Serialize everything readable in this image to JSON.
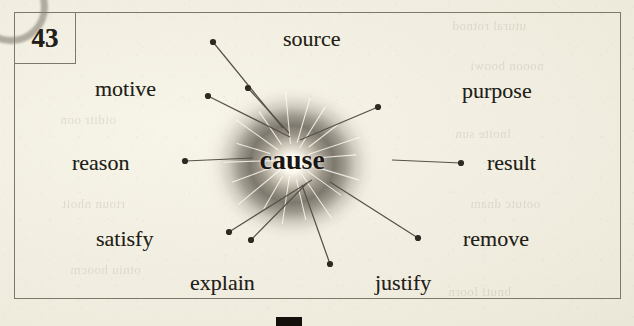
{
  "entry": {
    "number": "43",
    "center_word": "cause"
  },
  "colors": {
    "paper": "#f1eee1",
    "ink": "#231f18",
    "frame": "#7e786a",
    "leader": "#57514a",
    "burst_core": "#fffdf6",
    "burst_ring": "#706b60"
  },
  "diagram": {
    "type": "word-association-starburst",
    "center": {
      "x": 292,
      "y": 160
    },
    "labels": [
      {
        "id": "source",
        "text": "source",
        "text_x": 283,
        "text_y": 28,
        "dot_x": 213,
        "dot_y": 42,
        "line_end_x": 283,
        "line_end_y": 128
      },
      {
        "id": "motive",
        "text": "motive",
        "text_x": 95,
        "text_y": 78,
        "dot_x": 248,
        "dot_y": 88,
        "line_end_x": 289,
        "line_end_y": 133
      },
      {
        "id": "purpose",
        "text": "purpose",
        "text_x": 462,
        "text_y": 80,
        "dot_x": 378,
        "dot_y": 107,
        "line_end_x": 300,
        "line_end_y": 140
      },
      {
        "id": "reason",
        "text": "reason",
        "text_x": 72,
        "text_y": 152,
        "dot_x": 185,
        "dot_y": 161,
        "line_end_x": 253,
        "line_end_y": 158
      },
      {
        "id": "result",
        "text": "result",
        "text_x": 487,
        "text_y": 152,
        "dot_x": 461,
        "dot_y": 163,
        "line_end_x": 392,
        "line_end_y": 160
      },
      {
        "id": "satisfy",
        "text": "satisfy",
        "text_x": 96,
        "text_y": 228,
        "dot_x": 208,
        "dot_y": 96,
        "line_end_x": 290,
        "line_end_y": 137
      },
      {
        "id": "explain",
        "text": "explain",
        "text_x": 190,
        "text_y": 272,
        "dot_x": 251,
        "dot_y": 240,
        "line_end_x": 307,
        "line_end_y": 183
      },
      {
        "id": "justify",
        "text": "justify",
        "text_x": 375,
        "text_y": 272,
        "dot_x": 330,
        "dot_y": 264,
        "line_end_x": 302,
        "line_end_y": 185
      },
      {
        "id": "remove",
        "text": "remove",
        "text_x": 463,
        "text_y": 228,
        "dot_x": 418,
        "dot_y": 238,
        "line_end_x": 330,
        "line_end_y": 182
      },
      {
        "id": "extra-left",
        "text": "",
        "text_x": 0,
        "text_y": 0,
        "dot_x": 229,
        "dot_y": 232,
        "line_end_x": 312,
        "line_end_y": 180
      }
    ],
    "spokes": [
      {
        "a": 265,
        "r1": 18,
        "r2": 74
      },
      {
        "a": 285,
        "r1": 20,
        "r2": 70
      },
      {
        "a": 300,
        "r1": 16,
        "r2": 66
      },
      {
        "a": 320,
        "r1": 22,
        "r2": 60
      },
      {
        "a": 340,
        "r1": 18,
        "r2": 72
      },
      {
        "a": 355,
        "r1": 24,
        "r2": 64
      },
      {
        "a": 18,
        "r1": 18,
        "r2": 70
      },
      {
        "a": 38,
        "r1": 20,
        "r2": 62
      },
      {
        "a": 58,
        "r1": 16,
        "r2": 74
      },
      {
        "a": 78,
        "r1": 22,
        "r2": 66
      },
      {
        "a": 98,
        "r1": 18,
        "r2": 70
      },
      {
        "a": 118,
        "r1": 20,
        "r2": 60
      },
      {
        "a": 138,
        "r1": 17,
        "r2": 72
      },
      {
        "a": 158,
        "r1": 21,
        "r2": 64
      },
      {
        "a": 178,
        "r1": 19,
        "r2": 68
      },
      {
        "a": 198,
        "r1": 23,
        "r2": 58
      },
      {
        "a": 218,
        "r1": 18,
        "r2": 70
      },
      {
        "a": 238,
        "r1": 20,
        "r2": 62
      }
    ]
  },
  "artifacts": {
    "ghost_lines": [
      {
        "text": "utural  rotnod",
        "x": 452,
        "y": 18
      },
      {
        "text": "nooon  boowi",
        "x": 470,
        "y": 58
      },
      {
        "text": "oiditr  oon",
        "x": 60,
        "y": 112
      },
      {
        "text": "lnoite  sun",
        "x": 455,
        "y": 126
      },
      {
        "text": "rtoun  nhoit",
        "x": 62,
        "y": 196
      },
      {
        "text": "ooiutc  dnam",
        "x": 470,
        "y": 196
      },
      {
        "text": "otniu  hoocm",
        "x": 70,
        "y": 262
      },
      {
        "text": "bnuti  loorn",
        "x": 448,
        "y": 284
      }
    ]
  }
}
